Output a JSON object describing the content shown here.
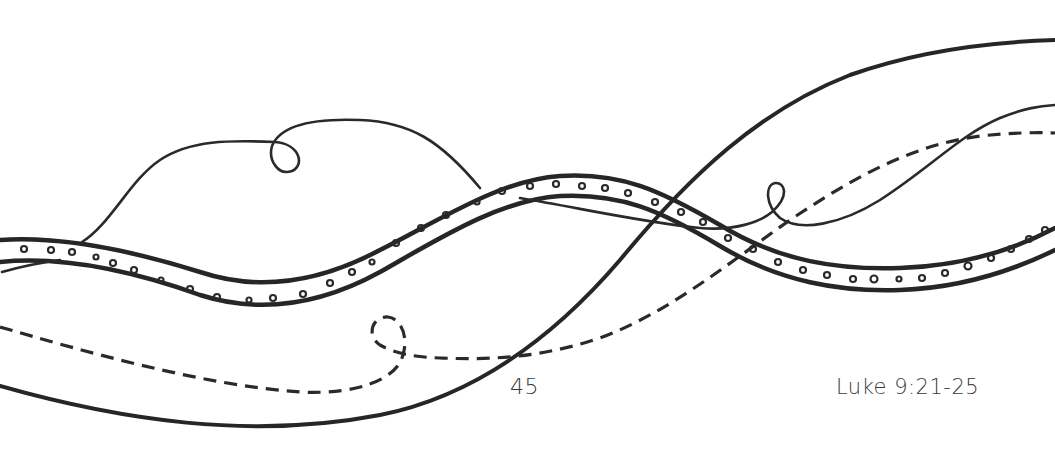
{
  "page": {
    "type": "coloring-page",
    "page_number": "45",
    "reference": "Luke 9:21-25"
  },
  "illustration": {
    "description": "Intertwining ribbons: a dotted double-line band, a thick sweeping line, a thin looping line, and a dashed looping line",
    "elements": [
      {
        "name": "dotted-band",
        "style": "double outline with small circles"
      },
      {
        "name": "thick-sweep-line",
        "style": "solid thick"
      },
      {
        "name": "thin-loop-line",
        "style": "solid thin with two loops"
      },
      {
        "name": "dashed-loop-line",
        "style": "dashed with one loop"
      }
    ],
    "stroke_color": "#262626",
    "background_color": "#ffffff"
  }
}
